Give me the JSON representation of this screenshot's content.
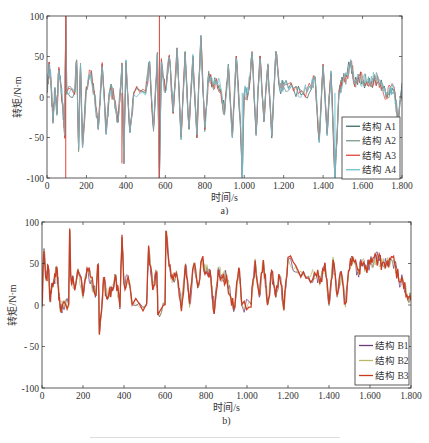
{
  "chart_data": [
    {
      "id": "a",
      "type": "line",
      "subfigure_label": "a)",
      "title": "",
      "xlabel": "时间/s",
      "ylabel": "转矩/N·m",
      "xlim": [
        0,
        1800
      ],
      "ylim": [
        -100,
        100
      ],
      "xticks": [
        0,
        200,
        400,
        600,
        800,
        1000,
        1200,
        1400,
        1600,
        1800
      ],
      "xtick_labels": [
        "0",
        "200",
        "400",
        "600",
        "800",
        "1.000",
        "1.200",
        "1.400",
        "1.600",
        "1.800"
      ],
      "yticks": [
        100,
        50,
        0,
        -50,
        -100
      ],
      "ytick_labels": [
        "100",
        "50",
        "0",
        "- 50",
        "-100"
      ],
      "grid": false,
      "legend_position": "lower right",
      "series": [
        {
          "name": "结构 A1",
          "color": "#3d6b66"
        },
        {
          "name": "结构 A2",
          "color": "#7a9a8a"
        },
        {
          "name": "结构 A3",
          "color": "#e0453a"
        },
        {
          "name": "结构 A4",
          "color": "#6fbfcf"
        }
      ],
      "x": [
        0,
        10,
        20,
        30,
        40,
        50,
        60,
        70,
        80,
        90,
        95,
        100,
        140,
        150,
        160,
        170,
        180,
        200,
        220,
        240,
        260,
        280,
        300,
        320,
        340,
        360,
        380,
        390,
        400,
        420,
        440,
        500,
        520,
        540,
        560,
        570,
        580,
        600,
        620,
        640,
        660,
        680,
        700,
        720,
        740,
        760,
        780,
        800,
        820,
        840,
        860,
        880,
        900,
        920,
        940,
        960,
        980,
        990,
        1000,
        1020,
        1040,
        1060,
        1080,
        1100,
        1120,
        1140,
        1160,
        1180,
        1200,
        1250,
        1300,
        1340,
        1360,
        1380,
        1400,
        1420,
        1440,
        1460,
        1480,
        1500,
        1520,
        1540,
        1560,
        1580,
        1600,
        1620,
        1640,
        1660,
        1680,
        1700,
        1720,
        1740,
        1760,
        1780,
        1800
      ],
      "values_envelope": [
        5,
        42,
        20,
        -30,
        10,
        -20,
        35,
        15,
        -10,
        -50,
        100,
        5,
        5,
        45,
        -65,
        40,
        -60,
        10,
        30,
        5,
        -40,
        40,
        -45,
        10,
        0,
        -30,
        40,
        -80,
        45,
        -45,
        5,
        5,
        45,
        -40,
        55,
        -100,
        45,
        5,
        50,
        -20,
        60,
        -50,
        55,
        -40,
        50,
        -50,
        75,
        -40,
        30,
        15,
        20,
        10,
        -20,
        40,
        -50,
        50,
        -30,
        -100,
        5,
        5,
        55,
        -45,
        50,
        -30,
        40,
        -50,
        55,
        10,
        15,
        10,
        5,
        10,
        25,
        -55,
        40,
        -45,
        30,
        -100,
        5,
        20,
        25,
        45,
        15,
        25,
        20,
        20,
        15,
        25,
        20,
        15,
        0,
        10,
        10,
        -30,
        15
      ],
      "annotations": []
    },
    {
      "id": "b",
      "type": "line",
      "subfigure_label": "b)",
      "title": "",
      "xlabel": "时间/s",
      "ylabel": "转矩/N·m",
      "xlim": [
        0,
        1800
      ],
      "ylim": [
        -100,
        100
      ],
      "xticks": [
        0,
        200,
        400,
        600,
        800,
        1000,
        1200,
        1400,
        1600,
        1800
      ],
      "xtick_labels": [
        "0",
        "200",
        "400",
        "600",
        "800",
        "1.000",
        "1.200",
        "1.400",
        "1.600",
        "1.800"
      ],
      "yticks": [
        100,
        50,
        0,
        -50,
        -100
      ],
      "ytick_labels": [
        "100",
        "50",
        "0",
        "- 50",
        "-100"
      ],
      "grid": false,
      "legend_position": "lower right",
      "series": [
        {
          "name": "结构 B1",
          "color": "#6a3a7a"
        },
        {
          "name": "结构 B2",
          "color": "#b8b86a"
        },
        {
          "name": "结构 B3",
          "color": "#c8381e"
        }
      ],
      "x": [
        0,
        10,
        20,
        30,
        40,
        50,
        60,
        70,
        80,
        90,
        100,
        130,
        135,
        140,
        160,
        180,
        200,
        220,
        240,
        260,
        275,
        280,
        300,
        320,
        340,
        360,
        380,
        390,
        400,
        420,
        440,
        510,
        520,
        540,
        560,
        565,
        600,
        605,
        620,
        640,
        660,
        680,
        700,
        720,
        740,
        760,
        780,
        800,
        820,
        840,
        860,
        880,
        900,
        920,
        940,
        960,
        975,
        1020,
        1040,
        1060,
        1080,
        1100,
        1120,
        1140,
        1160,
        1180,
        1200,
        1250,
        1300,
        1340,
        1360,
        1380,
        1400,
        1420,
        1440,
        1460,
        1480,
        1500,
        1520,
        1540,
        1560,
        1580,
        1600,
        1620,
        1640,
        1660,
        1680,
        1700,
        1720,
        1740,
        1760,
        1780,
        1800
      ],
      "values_envelope": [
        0,
        68,
        30,
        45,
        5,
        25,
        30,
        45,
        20,
        -5,
        0,
        0,
        90,
        35,
        20,
        40,
        10,
        45,
        30,
        10,
        50,
        -35,
        30,
        10,
        20,
        35,
        -5,
        82,
        25,
        35,
        0,
        0,
        70,
        20,
        40,
        -10,
        0,
        90,
        50,
        30,
        35,
        -5,
        50,
        0,
        50,
        20,
        55,
        40,
        40,
        -10,
        45,
        30,
        35,
        10,
        -5,
        45,
        0,
        0,
        55,
        10,
        55,
        0,
        40,
        10,
        35,
        -5,
        55,
        40,
        35,
        35,
        30,
        50,
        0,
        55,
        10,
        40,
        0,
        45,
        55,
        40,
        50,
        45,
        50,
        55,
        55,
        50,
        50,
        55,
        50,
        30,
        30,
        10,
        5
      ],
      "annotations": []
    }
  ],
  "figure": {
    "caption_line_visible": true
  }
}
